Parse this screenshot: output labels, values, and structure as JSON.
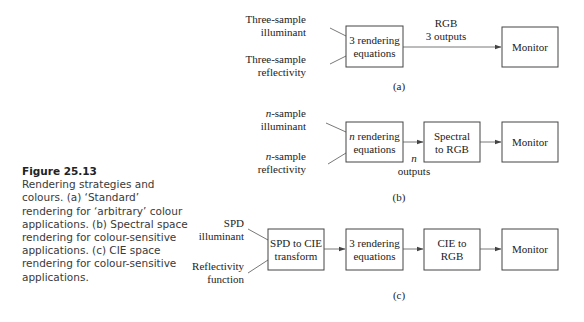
{
  "caption": {
    "title": "Figure 25.13",
    "text": "Rendering strategies and colours. (a) ‘Standard’ rendering for ‘arbitrary’ colour applications. (b) Spectral space rendering for colour-sensitive applications. (c) CIE space rendering for colour-sensitive applications."
  },
  "diagram_a": {
    "input1_line1": "Three-sample",
    "input1_line2": "illuminant",
    "input2_line1": "Three-sample",
    "input2_line2": "reflectivity",
    "box1_line1": "3 rendering",
    "box1_line2": "equations",
    "edge_label_line1": "RGB",
    "edge_label_line2": "3 outputs",
    "box2": "Monitor",
    "label": "(a)"
  },
  "diagram_b": {
    "input1_prefix": "n",
    "input1_line1_rest": "-sample",
    "input1_line2": "illuminant",
    "input2_prefix": "n",
    "input2_line1_rest": "-sample",
    "input2_line2": "reflectivity",
    "box1_prefix": "n",
    "box1_line1_rest": " rendering",
    "box1_line2": "equations",
    "edge_label_line1": "n",
    "edge_label_line2": "outputs",
    "box2_line1": "Spectral",
    "box2_line2": "to RGB",
    "box3": "Monitor",
    "label": "(b)"
  },
  "diagram_c": {
    "input1_line1": "SPD",
    "input1_line2": "illuminant",
    "input2_line1": "Reflectivity",
    "input2_line2": "function",
    "box1_line1": "SPD to CIE",
    "box1_line2": "transform",
    "box2_line1": "3 rendering",
    "box2_line2": "equations",
    "box3_line1": "CIE to",
    "box3_line2": "RGB",
    "box4": "Monitor",
    "label": "(c)"
  }
}
